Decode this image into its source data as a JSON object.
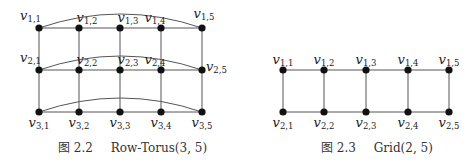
{
  "figures": [
    {
      "id": "row-torus",
      "caption_prefix": "图 2.2",
      "caption_title": "Row-Torus(3, 5)",
      "rows": 3,
      "cols": 5,
      "wraparound_rows": true,
      "col_x": [
        39,
        79,
        120,
        161,
        202
      ],
      "row_y": [
        28,
        70,
        112
      ],
      "labels": [
        [
          "v1,1",
          "v1,2",
          "v1,3",
          "v1,4",
          "v1,5"
        ],
        [
          "v2,1",
          "v2,2",
          "v2,3",
          "v2,4",
          "v2,5"
        ],
        [
          "v3,1",
          "v3,2",
          "v3,3",
          "v3,4",
          "v3,5"
        ]
      ]
    },
    {
      "id": "grid",
      "caption_prefix": "图 2.3",
      "caption_title": "Grid(2, 5)",
      "rows": 2,
      "cols": 5,
      "wraparound_rows": false,
      "col_x": [
        283,
        324,
        366,
        408,
        449
      ],
      "row_y": [
        70,
        112
      ],
      "labels": [
        [
          "v1,1",
          "v1,2",
          "v1,3",
          "v1,4",
          "v1,5"
        ],
        [
          "v2,1",
          "v2,2",
          "v2,3",
          "v2,4",
          "v2,5"
        ]
      ]
    }
  ],
  "colors": {
    "edge": "#555555",
    "node": "#111111",
    "text": "#222222"
  }
}
